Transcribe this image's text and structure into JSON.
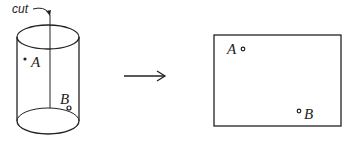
{
  "diagram": {
    "cylinder": {
      "cut_label": "cut",
      "point_a_label": "A",
      "point_b_label": "B"
    },
    "arrow": {
      "direction": "right"
    },
    "rectangle": {
      "point_a_label": "A",
      "point_b_label": "B"
    },
    "colors": {
      "stroke": "#222222",
      "background": "#ffffff"
    }
  }
}
